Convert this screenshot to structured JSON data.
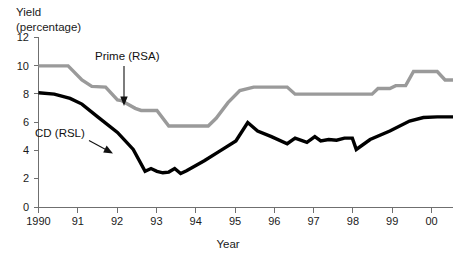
{
  "chart_data": {
    "type": "line",
    "title": "Yield (percentage)",
    "title_lines": [
      "Yield",
      "(percentage)"
    ],
    "xlabel": "Year",
    "ylabel": "Yield (percentage)",
    "xlim": [
      1990,
      2000.5
    ],
    "ylim": [
      0,
      12
    ],
    "y_ticks": [
      0,
      2,
      4,
      6,
      8,
      10,
      12
    ],
    "y_tick_labels": [
      "0",
      "2",
      "4",
      "6",
      "8",
      "10",
      "12"
    ],
    "x_ticks": [
      1990,
      1991,
      1992,
      1993,
      1994,
      1995,
      1996,
      1997,
      1998,
      1999,
      2000
    ],
    "x_tick_labels": [
      "1990",
      "91",
      "92",
      "93",
      "94",
      "95",
      "96",
      "97",
      "98",
      "99",
      "00"
    ],
    "grid": false,
    "legend_position": "inline-annotations",
    "series": [
      {
        "name": "Prime (RSA)",
        "color": "#9a9a9a",
        "x": [
          1990.0,
          1990.5,
          1990.75,
          1991.1,
          1991.35,
          1991.7,
          1992.0,
          1992.1,
          1992.45,
          1992.6,
          1993.0,
          1993.3,
          1994.3,
          1994.5,
          1994.8,
          1995.1,
          1995.45,
          1996.3,
          1996.5,
          1997.8,
          1998.0,
          1998.45,
          1998.6,
          1998.9,
          1999.05,
          1999.3,
          1999.5,
          2000.1,
          2000.3,
          2000.5
        ],
        "values": [
          10.0,
          10.0,
          10.0,
          9.0,
          8.55,
          8.5,
          7.6,
          7.55,
          7.0,
          6.85,
          6.85,
          5.75,
          5.75,
          6.3,
          7.4,
          8.25,
          8.5,
          8.5,
          8.0,
          8.0,
          8.0,
          8.0,
          8.4,
          8.4,
          8.6,
          8.6,
          9.6,
          9.6,
          9.0,
          9.0
        ]
      },
      {
        "name": "CD (RSL)",
        "color": "#000000",
        "x": [
          1990.0,
          1990.4,
          1990.8,
          1991.1,
          1991.5,
          1992.0,
          1992.4,
          1992.7,
          1992.85,
          1993.0,
          1993.15,
          1993.3,
          1993.45,
          1993.6,
          1993.75,
          1994.2,
          1994.6,
          1995.0,
          1995.3,
          1995.55,
          1995.9,
          1996.3,
          1996.5,
          1996.8,
          1997.0,
          1997.15,
          1997.35,
          1997.55,
          1997.75,
          1997.95,
          1998.05,
          1998.4,
          1998.9,
          1999.4,
          1999.75,
          2000.1,
          2000.5
        ],
        "values": [
          8.1,
          8.0,
          7.7,
          7.3,
          6.4,
          5.3,
          4.1,
          2.55,
          2.75,
          2.55,
          2.45,
          2.5,
          2.75,
          2.4,
          2.6,
          3.3,
          4.0,
          4.7,
          6.0,
          5.4,
          5.0,
          4.5,
          4.9,
          4.6,
          5.0,
          4.7,
          4.8,
          4.75,
          4.9,
          4.9,
          4.1,
          4.8,
          5.4,
          6.1,
          6.35,
          6.4,
          6.4
        ]
      }
    ],
    "annotations": [
      {
        "id": "prime-annotation",
        "text": "Prime (RSA)",
        "arrow": "down",
        "points_to_series": "Prime (RSA)"
      },
      {
        "id": "cd-annotation",
        "text": "CD (RSL)",
        "arrow": "down-right",
        "points_to_series": "CD (RSL)"
      }
    ]
  }
}
